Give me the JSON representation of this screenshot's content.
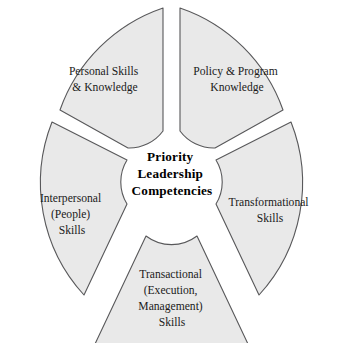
{
  "figure": {
    "type": "circular-segment-diagram",
    "center_label": {
      "lines": [
        "Priority",
        "Leadership",
        "Competencies"
      ],
      "line1": "Priority",
      "line2": "Leadership",
      "line3": "Competencies",
      "full_text": "Priority Leadership Competencies"
    },
    "cropped_top_text": "",
    "colors": {
      "segment_fill": "#e9e9e9",
      "segment_stroke": "#58585a",
      "text": "#1a1a1a",
      "center_text": "#000000",
      "background": "#ffffff"
    },
    "segments": [
      {
        "id": "personal-skills-knowledge",
        "position": "top-left",
        "lines": [
          "Personal Skills",
          "& Knowledge"
        ],
        "line1": "Personal Skills",
        "line2": "& Knowledge",
        "line3": "",
        "line4": "",
        "full_text": "Personal Skills & Knowledge"
      },
      {
        "id": "policy-program-knowledge",
        "position": "top-right",
        "lines": [
          "Policy & Program",
          "Knowledge"
        ],
        "line1": "Policy & Program",
        "line2": "Knowledge",
        "line3": "",
        "line4": "",
        "full_text": "Policy & Program Knowledge"
      },
      {
        "id": "transformational-skills",
        "position": "right",
        "lines": [
          "Transformational",
          "Skills"
        ],
        "line1": "Transformational",
        "line2": "Skills",
        "line3": "",
        "line4": "",
        "full_text": "Transformational Skills"
      },
      {
        "id": "transactional-skills",
        "position": "bottom",
        "lines": [
          "Transactional",
          "(Execution,",
          "Management)",
          "Skills"
        ],
        "line1": "Transactional",
        "line2": "(Execution,",
        "line3": "Management)",
        "line4": "Skills",
        "full_text": "Transactional (Execution, Management) Skills"
      },
      {
        "id": "interpersonal-people-skills",
        "position": "left",
        "lines": [
          "Interpersonal",
          "(People)",
          "Skills"
        ],
        "line1": "Interpersonal",
        "line2": "(People)",
        "line3": "Skills",
        "line4": "",
        "full_text": "Interpersonal (People) Skills"
      }
    ]
  }
}
